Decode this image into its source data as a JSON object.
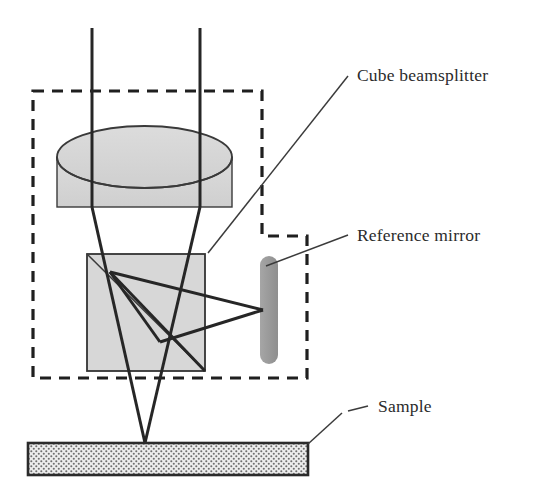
{
  "figure": {
    "background_color": "#ffffff",
    "ink_color": "#262626"
  },
  "labels": {
    "cube_beamsplitter": "Cube beamsplitter",
    "reference_mirror": "Reference mirror",
    "sample": "Sample"
  },
  "components": {
    "lens": {
      "name": "lens-cylinder",
      "fill": "#d5d5d5",
      "stroke": "#333333"
    },
    "beamsplitter_cube": {
      "name": "cube-beamsplitter-body",
      "fill": "#d7d7d7",
      "stroke": "#333333"
    },
    "reference_mirror": {
      "name": "reference-mirror-bar",
      "fill": "#9a9a9a",
      "stroke": "#9a9a9a"
    },
    "sample": {
      "name": "sample-block",
      "fill": "#e8e8e8",
      "stroke": "#2b2b2b",
      "texture": "stipple-dots"
    },
    "housing": {
      "name": "objective-housing-outline",
      "stroke": "#1f1f1f",
      "style": "dashed"
    },
    "rays": {
      "name": "light-rays",
      "stroke": "#262626"
    }
  }
}
